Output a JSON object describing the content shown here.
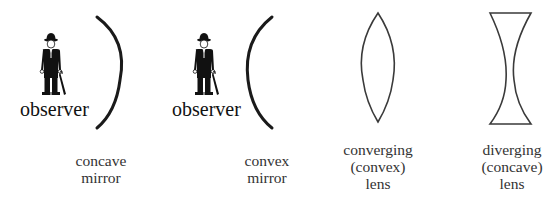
{
  "diagram": {
    "observers": [
      {
        "label": "observer",
        "icon": "man-with-bowler-hat-and-umbrella"
      },
      {
        "label": "observer",
        "icon": "man-with-bowler-hat-and-umbrella"
      }
    ],
    "elements": [
      {
        "id": "concave-mirror",
        "lines": [
          "concave",
          "mirror"
        ],
        "shape": "arc-opening-left"
      },
      {
        "id": "convex-mirror",
        "lines": [
          "convex",
          "mirror"
        ],
        "shape": "arc-opening-right"
      },
      {
        "id": "converging-lens",
        "lines": [
          "converging",
          "(convex)",
          "lens"
        ],
        "shape": "biconvex"
      },
      {
        "id": "diverging-lens",
        "lines": [
          "diverging",
          "(concave)",
          "lens"
        ],
        "shape": "biconcave"
      }
    ],
    "colors": {
      "stroke": "#1a1a1a",
      "lens_stroke": "#3a3a3a",
      "text": "#333333"
    }
  }
}
